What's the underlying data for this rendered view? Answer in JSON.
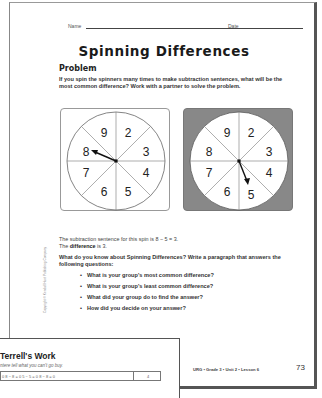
{
  "header": {
    "name_label": "Name",
    "date_label": "Date"
  },
  "title": "Spinning Differences",
  "problem": {
    "heading": "Problem",
    "text": "If you spin the spinners many times to make subtraction sentences, what will be the most common difference? Work with a partner to solve the problem."
  },
  "spinners": [
    {
      "numbers": [
        "9",
        "2",
        "3",
        "4",
        "5",
        "6",
        "7",
        "8"
      ],
      "pointer_to": "8",
      "background": "#ffffff"
    },
    {
      "numbers": [
        "9",
        "2",
        "3",
        "4",
        "5",
        "6",
        "7",
        "8"
      ],
      "pointer_to": "5",
      "background": "#888888"
    }
  ],
  "sentence": {
    "line1": "The subtraction sentence for this spin is 8 − 5 = 3.",
    "line2_pre": "The ",
    "line2_bold": "difference",
    "line2_post": " is 3."
  },
  "question": "What do you know about Spinning Differences? Write a paragraph that answers the following questions:",
  "bullets": [
    "What is your group's most common difference?",
    "What is your group's least common difference?",
    "What did your group do to find the answer?",
    "How did you decide on your answer?"
  ],
  "copyright": "Copyright © Kendall Hunt Publishing Company",
  "footer": {
    "text": "URG • Grade 3 • Unit 2 • Lesson 6",
    "page_number": "73"
  },
  "overlay": {
    "title": "Terrell's Work",
    "subtitle": "ntere tell what you can't go buy.",
    "table_cell": "0 8 − 8 = 0   5 − 5 = 0   8 − 8 = 0",
    "table_value": "4"
  }
}
